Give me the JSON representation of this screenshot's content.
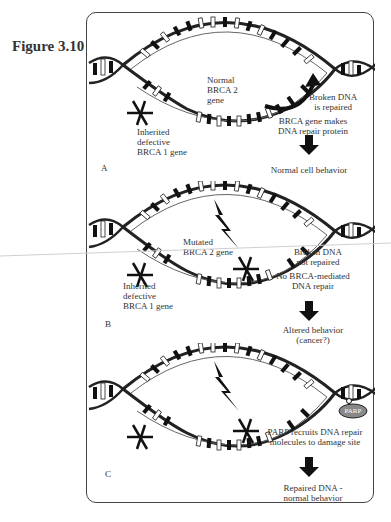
{
  "figure": {
    "label": "Figure 3.10"
  },
  "panels": [
    {
      "id": "A",
      "label": "A",
      "left_annotation": [
        "Inherited",
        "defective",
        "BRCA 1 gene"
      ],
      "mid_annotation": [
        "Normal",
        "BRCA 2",
        "gene"
      ],
      "right_top": [
        "Broken DNA",
        "is repaired"
      ],
      "right_mid": [
        "BRCA gene makes",
        "DNA repair protein"
      ],
      "outcome": "Normal cell behavior"
    },
    {
      "id": "B",
      "label": "B",
      "left_annotation": [
        "Inherited",
        "defective",
        "BRCA 1 gene"
      ],
      "mid_annotation": [
        "Mutated",
        "BRCA 2 gene"
      ],
      "right_top": [
        "Broken DNA",
        "not repaired"
      ],
      "right_mid": [
        "No BRCA-mediated",
        "DNA repair"
      ],
      "outcome_lines": [
        "Altered behavior",
        "(cancer?)"
      ]
    },
    {
      "id": "C",
      "label": "C",
      "parp_label": "PARP",
      "right_mid": [
        "PARP recruits DNA repair",
        "molecules to damage site"
      ],
      "outcome_lines": [
        "Repaired DNA -",
        "normal behavior"
      ]
    }
  ],
  "icons": {
    "down_arrow": "block-down-arrow",
    "lightning": "lightning-bolt",
    "cross": "x-mark",
    "curved_arrow": "curved-repair-arrow",
    "parp": "parp-oval"
  }
}
